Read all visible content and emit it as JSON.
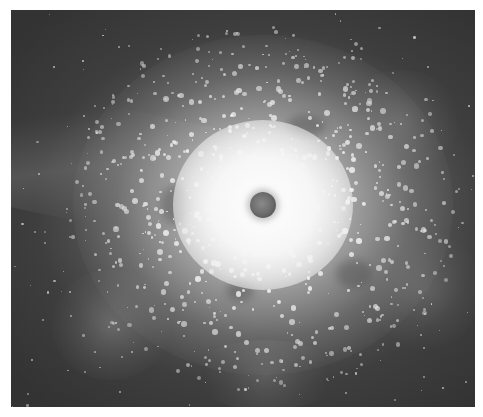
{
  "image": {
    "description": "Grayscale starburst explosion in space with dark central core",
    "palette": {
      "background_dark": "#333333",
      "background_mid": "#5a5a5a",
      "glow": "#f6f6f6",
      "core": "#6e6e6e",
      "border": "#ffffff"
    },
    "frame": {
      "x": 11,
      "y": 10,
      "width": 464,
      "height": 397
    },
    "core": {
      "cx": 263,
      "cy": 205,
      "radius": 13
    },
    "particles": {
      "count": 900,
      "seed": 42,
      "spread_x": 200,
      "spread_y": 185
    },
    "hazes": [
      {
        "x": 40,
        "y": 260,
        "w": 120,
        "h": 110,
        "o": 0.5
      },
      {
        "x": 330,
        "y": 60,
        "w": 120,
        "h": 100,
        "o": 0.3
      },
      {
        "x": 360,
        "y": 220,
        "w": 110,
        "h": 120,
        "o": 0.35
      },
      {
        "x": 180,
        "y": 330,
        "w": 150,
        "h": 70,
        "o": 0.35
      }
    ],
    "dark_patches": [
      {
        "x": 275,
        "y": 105,
        "w": 40,
        "h": 22
      },
      {
        "x": 150,
        "y": 175,
        "w": 30,
        "h": 40
      },
      {
        "x": 325,
        "y": 250,
        "w": 36,
        "h": 28
      },
      {
        "x": 215,
        "y": 270,
        "w": 28,
        "h": 22
      }
    ]
  }
}
